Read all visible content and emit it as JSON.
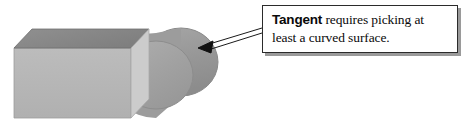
{
  "figure": {
    "background_color": "#ffffff",
    "width": 472,
    "height": 126
  },
  "callout": {
    "term": "Tangent",
    "body": " requires picking at least a curved surface.",
    "full_text": "Tangent requires picking at least a curved surface.",
    "border_color": "#2b2b2b",
    "shadow_color": "#9a9a9a",
    "fill_color": "#ffffff",
    "text_color": "#0a0a0a"
  },
  "leader": {
    "name": "leader-arrow",
    "from_x": 262,
    "from_y": 30,
    "to_x": 198,
    "to_y": 48,
    "style": "outlined-double-line-with-solid-head",
    "color": "#1a1a1a"
  },
  "shapes": [
    {
      "name": "box",
      "type": "cuboid",
      "top_face_color": "#898989",
      "front_face_color": "#b6b6b6",
      "side_face_color": "#cfcfcf",
      "outline_color": "#7a7a7a"
    },
    {
      "name": "cylinder",
      "type": "cylinder-end-on",
      "far_cap_color": "#969696",
      "near_cap_color": "#a2a2a2",
      "body_color": "#9c9c9c",
      "outline_color": "#8a8a8a"
    }
  ],
  "colors": {
    "page_background": "#ffffff",
    "ink": "#0a0a0a",
    "shape_gray_dark": "#898989",
    "shape_gray_mid": "#9c9c9c",
    "shape_gray_light": "#b6b6b6"
  }
}
